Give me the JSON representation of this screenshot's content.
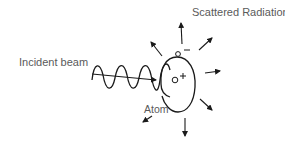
{
  "diagram": {
    "title": "Scattered Radiation",
    "labels": {
      "scattered_radiation": "Scattered Radiation",
      "incident_beam": "Incident beam",
      "atom": "Atom"
    },
    "charges": {
      "electron_sign": "−",
      "nucleus_sign": "+"
    },
    "colors": {
      "stroke": "#1a1a1a",
      "text": "#5a5a5a",
      "background": "#ffffff"
    },
    "scatter_arrows": [
      {
        "direction": "up"
      },
      {
        "direction": "upper-left"
      },
      {
        "direction": "upper-right"
      },
      {
        "direction": "right"
      },
      {
        "direction": "lower-right"
      },
      {
        "direction": "down"
      },
      {
        "direction": "lower-left"
      }
    ]
  }
}
